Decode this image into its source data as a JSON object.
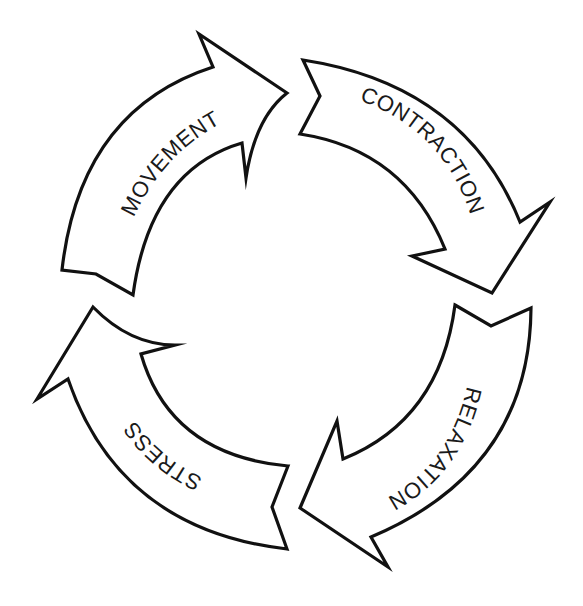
{
  "diagram": {
    "type": "cycle",
    "background": "#ffffff",
    "stroke_color": "#111111",
    "arrows": [
      {
        "label": "MOVEMENT",
        "position": "top-left",
        "direction": "clockwise"
      },
      {
        "label": "CONTRACTION",
        "position": "top-right",
        "direction": "clockwise"
      },
      {
        "label": "RELAXATION",
        "position": "bottom-right",
        "direction": "clockwise"
      },
      {
        "label": "STRESS",
        "position": "bottom-left",
        "direction": "clockwise"
      }
    ],
    "sequence": [
      "MOVEMENT",
      "CONTRACTION",
      "RELAXATION",
      "STRESS"
    ]
  }
}
